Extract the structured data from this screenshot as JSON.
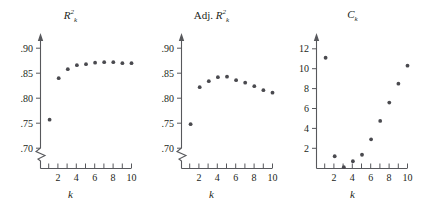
{
  "figure": {
    "panel_count": 3,
    "dot_color": "#4a4a4f",
    "axis_color": "#57585c",
    "background": "#ffffff"
  },
  "chart_data": [
    {
      "type": "scatter",
      "title": "R²ₖ",
      "title_parts": {
        "base": "R",
        "sup": "2",
        "sub": "k",
        "prefix": ""
      },
      "xlabel": "k",
      "ylabel": "",
      "x": [
        1,
        2,
        3,
        4,
        5,
        6,
        7,
        8,
        9,
        10
      ],
      "values": [
        0.757,
        0.84,
        0.858,
        0.866,
        0.868,
        0.871,
        0.872,
        0.872,
        0.87,
        0.87
      ],
      "xtick_values": [
        1,
        2,
        3,
        4,
        5,
        6,
        7,
        8,
        9,
        10
      ],
      "xticklabels": [
        "",
        "2",
        "",
        "4",
        "",
        "6",
        "",
        "8",
        "",
        "10"
      ],
      "ytick_values": [
        0.7,
        0.75,
        0.8,
        0.85,
        0.9
      ],
      "yticklabels": [
        ".70",
        ".75",
        ".80",
        ".85",
        ".90"
      ],
      "ylim": [
        0.695,
        0.925
      ],
      "xlim": [
        0,
        11
      ],
      "axis_break": true,
      "grid": false,
      "legend": null
    },
    {
      "type": "scatter",
      "title": "Adj. R²ₖ",
      "title_parts": {
        "base": "R",
        "sup": "2",
        "sub": "k",
        "prefix": "Adj."
      },
      "xlabel": "k",
      "ylabel": "",
      "x": [
        1,
        2,
        3,
        4,
        5,
        6,
        7,
        8,
        9,
        10
      ],
      "values": [
        0.748,
        0.822,
        0.834,
        0.842,
        0.843,
        0.836,
        0.831,
        0.824,
        0.816,
        0.811
      ],
      "xtick_values": [
        1,
        2,
        3,
        4,
        5,
        6,
        7,
        8,
        9,
        10
      ],
      "xticklabels": [
        "",
        "2",
        "",
        "4",
        "",
        "6",
        "",
        "8",
        "",
        "10"
      ],
      "ytick_values": [
        0.7,
        0.75,
        0.8,
        0.85,
        0.9
      ],
      "yticklabels": [
        ".70",
        ".75",
        ".80",
        ".85",
        ".90"
      ],
      "ylim": [
        0.695,
        0.925
      ],
      "xlim": [
        0,
        11
      ],
      "axis_break": true,
      "grid": false,
      "legend": null
    },
    {
      "type": "scatter",
      "title": "Cₖ",
      "title_parts": {
        "base": "C",
        "sup": "",
        "sub": "k",
        "prefix": ""
      },
      "xlabel": "k",
      "ylabel": "",
      "x": [
        1,
        2,
        3,
        4,
        5,
        6,
        7,
        8,
        9,
        10
      ],
      "values": [
        11.1,
        1.2,
        0.1,
        0.7,
        1.35,
        2.9,
        4.75,
        6.6,
        8.5,
        10.3
      ],
      "xtick_values": [
        1,
        2,
        3,
        4,
        5,
        6,
        7,
        8,
        9,
        10
      ],
      "xticklabels": [
        "",
        "2",
        "",
        "4",
        "",
        "6",
        "",
        "8",
        "",
        "10"
      ],
      "ytick_values": [
        2,
        4,
        6,
        8,
        10,
        12
      ],
      "yticklabels": [
        "2",
        "4",
        "6",
        "8",
        "10",
        "12"
      ],
      "ylim": [
        0,
        13.4
      ],
      "xlim": [
        0,
        11
      ],
      "axis_break": false,
      "grid": false,
      "legend": null
    }
  ]
}
